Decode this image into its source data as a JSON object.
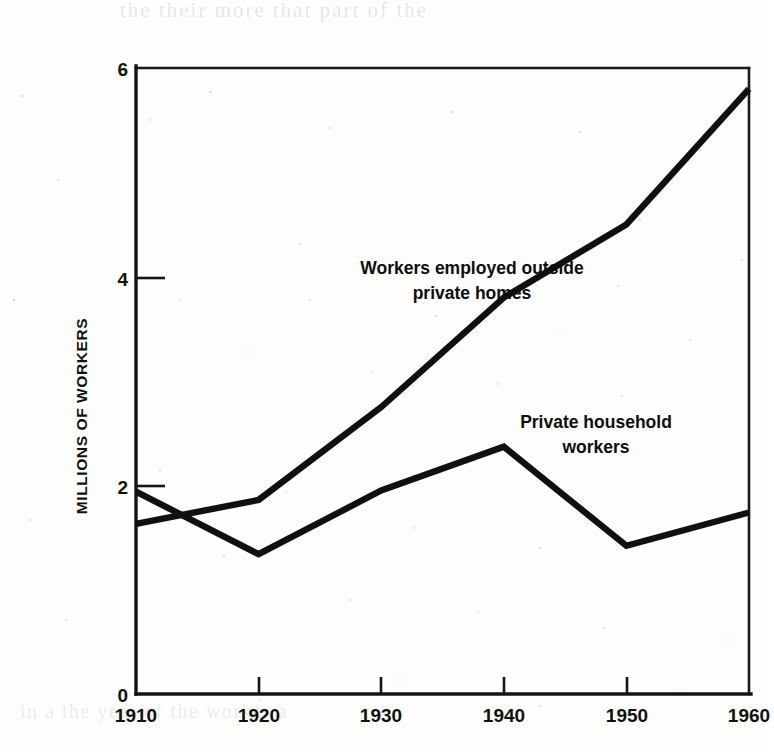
{
  "page": {
    "background_color": "#fdfdfc",
    "ink_color": "#111111",
    "bleed_through_top": "the  their  more  that  part  of  the",
    "bleed_through_bottom": "in  a  the  year  of  the  worker  a"
  },
  "chart_data": {
    "type": "line",
    "title": "",
    "xlabel": "",
    "ylabel": "MILLIONS OF WORKERS",
    "x": [
      1910,
      1920,
      1930,
      1940,
      1950,
      1960
    ],
    "xtick_labels": [
      "1910",
      "1920",
      "1930",
      "1940",
      "1950",
      "1960"
    ],
    "ytick_labels": [
      "0",
      "2",
      "4",
      "6"
    ],
    "yticks": [
      0,
      2,
      4,
      6
    ],
    "xlim": [
      1910,
      1960
    ],
    "ylim": [
      0,
      6
    ],
    "grid": false,
    "legend_position": "inline-annotations",
    "series": [
      {
        "name": "Workers employed outside private homes",
        "label_lines": [
          "Workers employed outside",
          "private homes"
        ],
        "color": "#101010",
        "values": [
          1.63,
          1.86,
          2.75,
          3.8,
          4.5,
          5.8
        ]
      },
      {
        "name": "Private household workers",
        "label_lines": [
          "Private household",
          "workers"
        ],
        "color": "#101010",
        "values": [
          1.94,
          1.34,
          1.95,
          2.37,
          1.42,
          1.74
        ]
      }
    ],
    "annotations": [
      {
        "text": "Workers employed outside",
        "x_px": 432,
        "y_px": 258
      },
      {
        "text": "private homes",
        "x_px": 432,
        "y_px": 283
      },
      {
        "text": "Private household",
        "x_px": 556,
        "y_px": 412
      },
      {
        "text": "workers",
        "x_px": 556,
        "y_px": 437
      }
    ]
  }
}
